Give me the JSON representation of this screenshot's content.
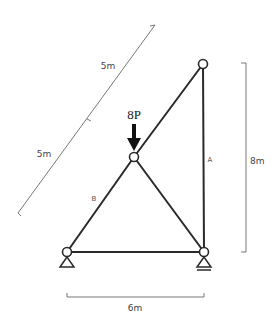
{
  "diagram": {
    "type": "truss",
    "load": {
      "label": "8P",
      "node": "top-middle"
    },
    "members": [
      {
        "id": "A",
        "label": "A"
      },
      {
        "id": "B",
        "label": "B"
      }
    ],
    "dimensions": {
      "diagonal_upper": "5m",
      "diagonal_lower": "5m",
      "vertical": "8m",
      "horizontal": "6m"
    },
    "supports": {
      "left": "pin",
      "right": "roller"
    },
    "colors": {
      "member": "#2a2a2a",
      "dimension": "#777777",
      "background": "#ffffff"
    }
  }
}
